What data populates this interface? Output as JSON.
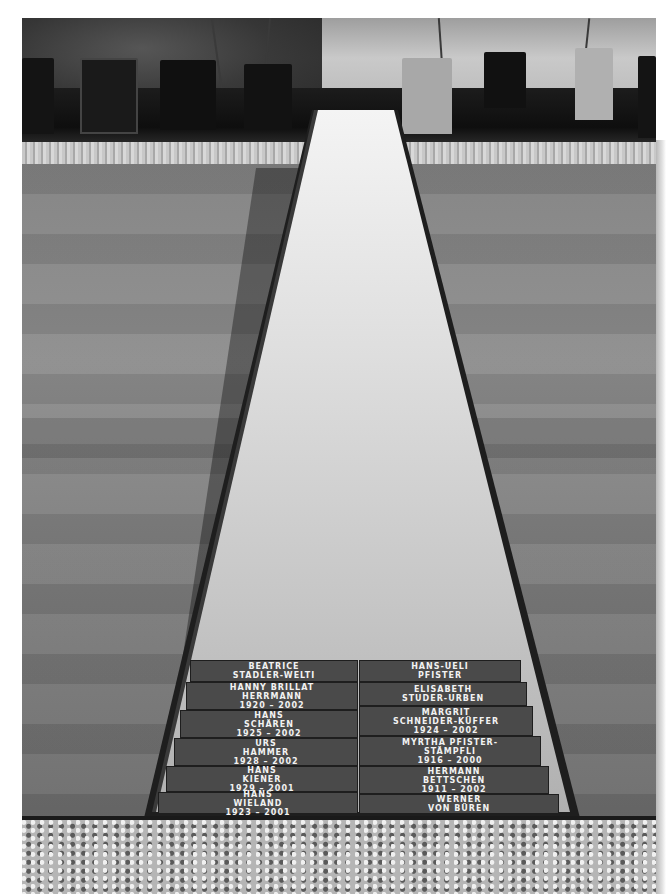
{
  "scene": {
    "description": "Grayscale photograph of a cemetery memorial walkway: a long narrow stone path framed in dark metal, flanked by lawn, with engraved name plaques at the near end and gravestones behind a hedge in the background.",
    "palette": {
      "background": "#ffffff",
      "path_stone": "#cfcfcf",
      "path_frame": "#1e1e1e",
      "lawn": "#848484",
      "hedge": "#141414",
      "plaque": "#4a4a4a",
      "engraving": "#f2f2f2"
    }
  },
  "plaques": {
    "left": [
      {
        "line1": "BEATRICE",
        "line2": "STADLER-WELTI",
        "years": "1941 – 2002"
      },
      {
        "line1": "HANNY BRILLAT",
        "line2": "HERRMANN",
        "years": "1920 – 2002"
      },
      {
        "line1": "HANS",
        "line2": "SCHÄREN",
        "years": "1925 – 2002"
      },
      {
        "line1": "URS",
        "line2": "HAMMER",
        "years": "1928 – 2002"
      },
      {
        "line1": "HANS",
        "line2": "KIENER",
        "years": "1929 – 2001"
      },
      {
        "line1": "HANS",
        "line2": "WIELAND",
        "years": "1923 – 2001"
      }
    ],
    "right": [
      {
        "line1": "HANS-UELI",
        "line2": "PFISTER",
        "years": "1947 – 2002"
      },
      {
        "line1": "ELISABETH",
        "line2": "STUDER-URBEN",
        "years": "1929 – 2002"
      },
      {
        "line1": "MARGRIT",
        "line2": "SCHNEIDER-KÜFFER",
        "years": "1924 – 2002"
      },
      {
        "line1": "MYRTHA PFISTER-",
        "line2": "STÄMPFLI",
        "years": "1916 – 2000"
      },
      {
        "line1": "HERMANN",
        "line2": "BETTSCHEN",
        "years": "1911 – 2002"
      },
      {
        "line1": "WERNER",
        "line2": "VON BÜREN",
        "years": "1912 – 2001"
      }
    ]
  }
}
